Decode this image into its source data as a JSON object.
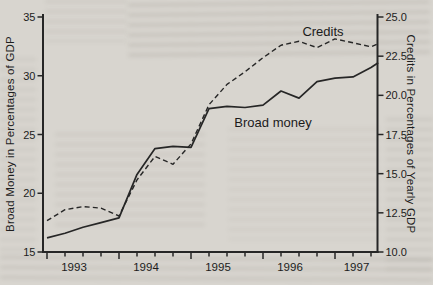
{
  "page": {
    "background_color": "#d8d5cf",
    "appearance": "grayscale scanned book figure with print bleed-through"
  },
  "chart_data": {
    "type": "line",
    "title": "",
    "line_color": "#262626",
    "plot": {
      "left_px": 43,
      "right_px": 377.5,
      "top_px": 14,
      "bottom_px": 252,
      "value_top_px": 17
    },
    "x": {
      "year_labels": [
        "1993",
        "1994",
        "1995",
        "1996",
        "1997"
      ],
      "year_label_px": [
        74,
        146,
        218,
        290,
        356.5
      ],
      "tick_px_start": 47,
      "tick_px_step": 18,
      "tick_count": 19,
      "long_tick_every": 4
    },
    "left_axis": {
      "title": "Broad Money in Percentages of GDP",
      "range": [
        15,
        35
      ],
      "ticks": [
        15,
        20,
        25,
        30,
        35
      ],
      "tick_labels": [
        "15",
        "20",
        "25",
        "30",
        "35"
      ]
    },
    "right_axis": {
      "title": "Credits in Percentages of Yearly GDP",
      "range": [
        10,
        25
      ],
      "ticks": [
        10,
        12.5,
        15,
        17.5,
        20,
        22.5,
        25
      ],
      "tick_labels": [
        "10.0",
        "12.5",
        "15.0",
        "17.5",
        "20.0",
        "22.5",
        "25.0"
      ]
    },
    "x_quarters": [
      0,
      1,
      2,
      3,
      4,
      5,
      6,
      7,
      8,
      9,
      10,
      11,
      12,
      13,
      14,
      15,
      16,
      17,
      18,
      18.4
    ],
    "series": [
      {
        "name": "Broad money",
        "axis": "left",
        "line_style": "solid",
        "values": [
          16.2,
          16.6,
          17.1,
          17.5,
          17.9,
          21.6,
          23.8,
          24.0,
          23.9,
          27.2,
          27.4,
          27.3,
          27.5,
          28.7,
          28.1,
          29.5,
          29.8,
          29.9,
          30.7,
          31.1
        ]
      },
      {
        "name": "Credits",
        "axis": "right",
        "line_style": "dashed",
        "values": [
          12.0,
          12.7,
          12.9,
          12.8,
          12.3,
          14.6,
          16.1,
          15.6,
          16.9,
          19.4,
          20.7,
          21.5,
          22.4,
          23.2,
          23.45,
          23.05,
          23.6,
          23.35,
          23.1,
          23.3
        ]
      }
    ],
    "annotations": [
      {
        "text": "Credits",
        "center_px": [
          323,
          31
        ]
      },
      {
        "text": "Broad money",
        "center_px": [
          273,
          122
        ]
      }
    ],
    "legend": "in-plot text labels, no legend box",
    "grid": "off"
  }
}
